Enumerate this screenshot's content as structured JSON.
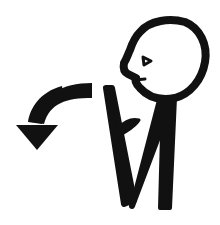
{
  "symbol": {
    "description": "Pictogram: person in profile with hand near chest and a curved arrow pointing back-down-left",
    "colors": {
      "ink": "#111111",
      "background": "#ffffff"
    },
    "parts": {
      "head": "head-profile-icon",
      "body": "body-arms-icon",
      "arrow": "curved-arrow-down-left-icon"
    }
  }
}
